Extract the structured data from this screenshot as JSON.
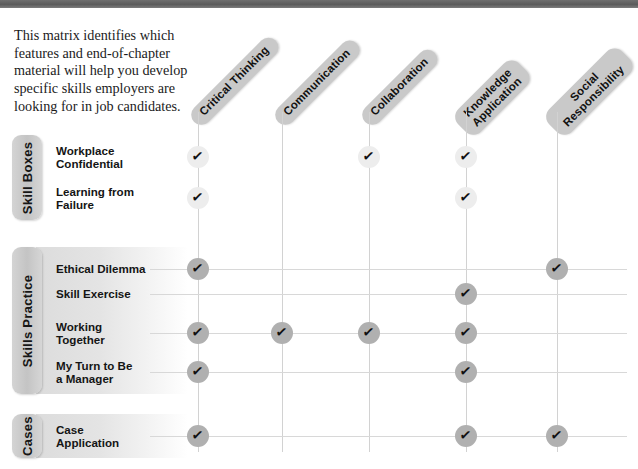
{
  "intro": {
    "text": "This matrix identifies which features and end-of-chapter material will help you develop specific skills employers are looking for in job candidates."
  },
  "columns": [
    {
      "label": "Critical Thinking",
      "x": 198
    },
    {
      "label": "Communication",
      "x": 282
    },
    {
      "label": "Collaboration",
      "x": 369
    },
    {
      "label": "Knowledge\nApplication",
      "x": 466
    },
    {
      "label": "Social\nResponsibility",
      "x": 557
    }
  ],
  "sections": [
    {
      "tab_label": "Skill Boxes",
      "style": "light",
      "rows": [
        {
          "label": "Workplace\nConfidential",
          "y": 157,
          "checks": [
            true,
            false,
            true,
            true,
            false
          ]
        },
        {
          "label": "Learning from\nFailure",
          "y": 198,
          "checks": [
            true,
            false,
            false,
            true,
            false
          ]
        }
      ]
    },
    {
      "tab_label": "Skills Practice",
      "style": "dark",
      "rows": [
        {
          "label": "Ethical Dilemma",
          "y": 269,
          "checks": [
            true,
            false,
            false,
            false,
            true
          ]
        },
        {
          "label": "Skill Exercise",
          "y": 294,
          "checks": [
            false,
            false,
            false,
            true,
            false
          ]
        },
        {
          "label": "Working\nTogether",
          "y": 333,
          "checks": [
            true,
            true,
            true,
            true,
            false
          ]
        },
        {
          "label": "My Turn to Be\na Manager",
          "y": 372,
          "checks": [
            true,
            false,
            false,
            true,
            false
          ]
        }
      ]
    },
    {
      "tab_label": "Cases",
      "style": "dark",
      "rows": [
        {
          "label": "Case\nApplication",
          "y": 436,
          "checks": [
            true,
            false,
            false,
            true,
            true
          ]
        }
      ]
    }
  ],
  "icons": {
    "check": "✓"
  },
  "colors": {
    "header_pill": "#c9c9c9",
    "tab": "#c4c4c4",
    "check_light": "#ededed",
    "check_dark": "#b0b0b0",
    "grid_line": "#d2d2d2",
    "top_bar": "#5b5b5b"
  }
}
